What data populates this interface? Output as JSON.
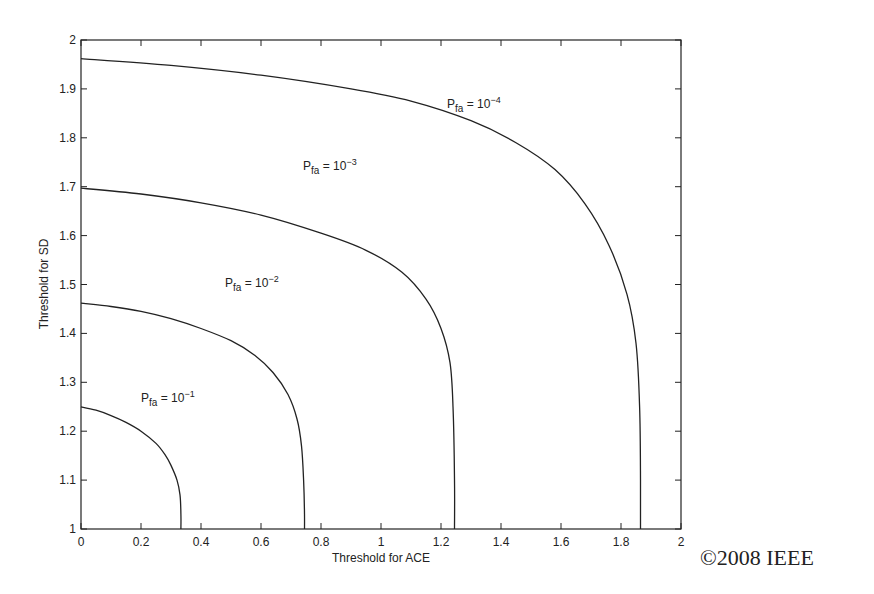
{
  "chart_data": {
    "type": "line",
    "title": "",
    "xlabel": "Threshold for ACE",
    "ylabel": "Threshold for SD",
    "xlim": [
      0,
      2
    ],
    "ylim": [
      1,
      2
    ],
    "xticks": [
      "0",
      "0.2",
      "0.4",
      "0.6",
      "0.8",
      "1",
      "1.2",
      "1.4",
      "1.6",
      "1.8",
      "2"
    ],
    "yticks": [
      "1",
      "1.1",
      "1.2",
      "1.3",
      "1.4",
      "1.5",
      "1.6",
      "1.7",
      "1.8",
      "1.9",
      "2"
    ],
    "grid": false,
    "legend": "inline labels",
    "series": [
      {
        "name": "Pfa = 10^-1",
        "label_base": "P",
        "label_sub": "fa",
        "label_eq": "= 10",
        "label_sup": "−1",
        "label_pos": [
          0.2,
          1.26
        ],
        "x": [
          0,
          0.05,
          0.1,
          0.15,
          0.2,
          0.25,
          0.28,
          0.3,
          0.32,
          0.33,
          0.333,
          0.333
        ],
        "y": [
          1.25,
          1.243,
          1.232,
          1.218,
          1.2,
          1.175,
          1.152,
          1.13,
          1.1,
          1.07,
          1.03,
          1.0
        ]
      },
      {
        "name": "Pfa = 10^-2",
        "label_base": "P",
        "label_sub": "fa",
        "label_eq": "= 10",
        "label_sup": "−2",
        "label_pos": [
          0.48,
          1.495
        ],
        "x": [
          0,
          0.1,
          0.2,
          0.3,
          0.4,
          0.5,
          0.58,
          0.64,
          0.69,
          0.72,
          0.735,
          0.742,
          0.745,
          0.745
        ],
        "y": [
          1.462,
          1.455,
          1.445,
          1.43,
          1.41,
          1.385,
          1.355,
          1.32,
          1.275,
          1.225,
          1.17,
          1.1,
          1.03,
          1.0
        ]
      },
      {
        "name": "Pfa = 10^-3",
        "label_base": "P",
        "label_sub": "fa",
        "label_eq": "= 10",
        "label_sup": "−3",
        "label_pos": [
          0.74,
          1.735
        ],
        "x": [
          0,
          0.2,
          0.4,
          0.6,
          0.8,
          0.95,
          1.07,
          1.15,
          1.2,
          1.23,
          1.24,
          1.245,
          1.245
        ],
        "y": [
          1.697,
          1.685,
          1.667,
          1.642,
          1.605,
          1.57,
          1.525,
          1.47,
          1.41,
          1.34,
          1.25,
          1.1,
          1.0
        ]
      },
      {
        "name": "Pfa = 10^-4",
        "label_base": "P",
        "label_sub": "fa",
        "label_eq": "= 10",
        "label_sup": "−4",
        "label_pos": [
          1.22,
          1.86
        ],
        "x": [
          0,
          0.3,
          0.6,
          0.9,
          1.1,
          1.3,
          1.45,
          1.58,
          1.68,
          1.76,
          1.82,
          1.85,
          1.862,
          1.865,
          1.865
        ],
        "y": [
          1.962,
          1.948,
          1.928,
          1.9,
          1.875,
          1.835,
          1.79,
          1.735,
          1.665,
          1.58,
          1.48,
          1.38,
          1.25,
          1.1,
          1.0
        ]
      }
    ]
  },
  "footer": {
    "copyright": "©2008 IEEE"
  },
  "layout": {
    "plot": {
      "left": 81,
      "top": 40,
      "right": 681,
      "bottom": 529
    },
    "line_color": "#222222",
    "axis_color": "#222222",
    "text_color": "#222222"
  }
}
